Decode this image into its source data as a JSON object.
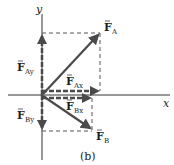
{
  "figure": {
    "caption": "(b)",
    "axes": {
      "x_label": "x",
      "y_label": "y"
    },
    "vectors": {
      "F_A": {
        "symbol": "F",
        "subscript": "A"
      },
      "F_Ax": {
        "symbol": "F",
        "subscript": "Ax"
      },
      "F_Ay": {
        "symbol": "F",
        "subscript": "Ay"
      },
      "F_B": {
        "symbol": "F",
        "subscript": "B"
      },
      "F_Bx": {
        "symbol": "F",
        "subscript": "Bx"
      },
      "F_By": {
        "symbol": "F",
        "subscript": "By"
      }
    },
    "colors": {
      "vector": "#4a4a4a",
      "axis": "#333333",
      "dashed": "#555555",
      "text": "#222222"
    }
  }
}
